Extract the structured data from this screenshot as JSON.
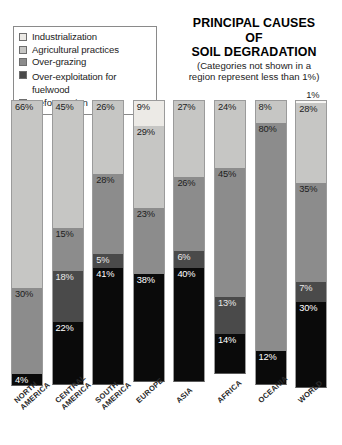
{
  "title": {
    "line1": "PRINCIPAL CAUSES",
    "line2": "OF",
    "line3": "SOIL DEGRADATION",
    "note_line1": "(Categories not shown in a",
    "note_line2": "region represent less than 1%)"
  },
  "legend": {
    "items": [
      {
        "label": "Industrialization",
        "color": "#eceae6"
      },
      {
        "label": "Agricultural practices",
        "color": "#c6c6c4"
      },
      {
        "label": "Over-grazing",
        "color": "#8c8c8c"
      },
      {
        "label": "Over-exploitation for",
        "label2": "fuelwood",
        "color": "#4a4a4a"
      },
      {
        "label": "Deforestation",
        "color": "#0a0a0a"
      }
    ]
  },
  "chart_data": {
    "type": "bar",
    "subtype": "stacked-bar-100",
    "title": "PRINCIPAL CAUSES OF SOIL DEGRADATION",
    "subtitle": "(Categories not shown in a region represent less than 1%)",
    "xlabel": "",
    "ylabel": "",
    "ylim": [
      0,
      100
    ],
    "grid": false,
    "legend_position": "top-left",
    "stack_order_top_to_bottom": [
      "Industrialization",
      "Agricultural practices",
      "Over-grazing",
      "Over-exploitation for fuelwood",
      "Deforestation"
    ],
    "categories": [
      "NORTH AMERICA",
      "CENTRAL AMERICA",
      "SOUTH AMERICA",
      "EUROPE",
      "ASIA",
      "AFRICA",
      "OCEANIA",
      "WORLD"
    ],
    "series": [
      {
        "name": "Industrialization",
        "color": "#eceae6",
        "values": [
          null,
          null,
          null,
          9,
          null,
          null,
          null,
          1
        ]
      },
      {
        "name": "Agricultural practices",
        "color": "#c6c6c4",
        "values": [
          66,
          45,
          26,
          29,
          27,
          24,
          8,
          28
        ]
      },
      {
        "name": "Over-grazing",
        "color": "#8c8c8c",
        "values": [
          30,
          15,
          28,
          23,
          26,
          45,
          80,
          35
        ]
      },
      {
        "name": "Over-exploitation for fuelwood",
        "color": "#4a4a4a",
        "values": [
          null,
          18,
          5,
          null,
          6,
          13,
          null,
          7
        ]
      },
      {
        "name": "Deforestation",
        "color": "#0a0a0a",
        "values": [
          4,
          22,
          41,
          38,
          40,
          14,
          12,
          30
        ]
      }
    ]
  },
  "columns": [
    {
      "name": "NORTH AMERICA",
      "label_lines": "NORTH\nAMERICA",
      "segments": [
        {
          "label": "66%",
          "value": 66,
          "color": "#c6c6c4",
          "text": "#1c1c1c",
          "outside": false
        },
        {
          "label": "30%",
          "value": 30,
          "color": "#8c8c8c",
          "text": "#1c1c1c",
          "outside": false
        },
        {
          "label": "4%",
          "value": 4,
          "color": "#0a0a0a",
          "text": "#ffffff",
          "outside": false
        }
      ]
    },
    {
      "name": "CENTRAL AMERICA",
      "label_lines": "CENTRAL\nAMERICA",
      "segments": [
        {
          "label": "45%",
          "value": 45,
          "color": "#c6c6c4",
          "text": "#1c1c1c",
          "outside": false
        },
        {
          "label": "15%",
          "value": 15,
          "color": "#8c8c8c",
          "text": "#1c1c1c",
          "outside": false
        },
        {
          "label": "18%",
          "value": 18,
          "color": "#4a4a4a",
          "text": "#e8e8e8",
          "outside": false
        },
        {
          "label": "22%",
          "value": 22,
          "color": "#0a0a0a",
          "text": "#ffffff",
          "outside": false
        }
      ]
    },
    {
      "name": "SOUTH AMERICA",
      "label_lines": "SOUTH\nAMERICA",
      "segments": [
        {
          "label": "26%",
          "value": 26,
          "color": "#c6c6c4",
          "text": "#1c1c1c",
          "outside": false
        },
        {
          "label": "28%",
          "value": 28,
          "color": "#8c8c8c",
          "text": "#1c1c1c",
          "outside": false
        },
        {
          "label": "5%",
          "value": 5,
          "color": "#4a4a4a",
          "text": "#e8e8e8",
          "outside": false
        },
        {
          "label": "41%",
          "value": 41,
          "color": "#0a0a0a",
          "text": "#ffffff",
          "outside": false
        }
      ]
    },
    {
      "name": "EUROPE",
      "label_lines": "EUROPE",
      "segments": [
        {
          "label": "9%",
          "value": 9,
          "color": "#eceae6",
          "text": "#1c1c1c",
          "outside": false
        },
        {
          "label": "29%",
          "value": 29,
          "color": "#c6c6c4",
          "text": "#1c1c1c",
          "outside": false
        },
        {
          "label": "23%",
          "value": 23,
          "color": "#8c8c8c",
          "text": "#1c1c1c",
          "outside": false
        },
        {
          "label": "38%",
          "value": 38,
          "color": "#0a0a0a",
          "text": "#ffffff",
          "outside": false
        }
      ]
    },
    {
      "name": "ASIA",
      "label_lines": "ASIA",
      "segments": [
        {
          "label": "27%",
          "value": 27,
          "color": "#c6c6c4",
          "text": "#1c1c1c",
          "outside": false
        },
        {
          "label": "26%",
          "value": 26,
          "color": "#8c8c8c",
          "text": "#1c1c1c",
          "outside": false
        },
        {
          "label": "6%",
          "value": 6,
          "color": "#4a4a4a",
          "text": "#e8e8e8",
          "outside": false
        },
        {
          "label": "40%",
          "value": 40,
          "color": "#0a0a0a",
          "text": "#ffffff",
          "outside": false
        }
      ]
    },
    {
      "name": "AFRICA",
      "label_lines": "AFRICA",
      "segments": [
        {
          "label": "24%",
          "value": 24,
          "color": "#c6c6c4",
          "text": "#1c1c1c",
          "outside": false
        },
        {
          "label": "45%",
          "value": 45,
          "color": "#8c8c8c",
          "text": "#1c1c1c",
          "outside": false
        },
        {
          "label": "13%",
          "value": 13,
          "color": "#4a4a4a",
          "text": "#e8e8e8",
          "outside": false
        },
        {
          "label": "14%",
          "value": 14,
          "color": "#0a0a0a",
          "text": "#ffffff",
          "outside": false
        }
      ]
    },
    {
      "name": "OCEANIA",
      "label_lines": "OCEANIA",
      "segments": [
        {
          "label": "8%",
          "value": 8,
          "color": "#c6c6c4",
          "text": "#1c1c1c",
          "outside": false
        },
        {
          "label": "80%",
          "value": 80,
          "color": "#8c8c8c",
          "text": "#1c1c1c",
          "outside": false
        },
        {
          "label": "12%",
          "value": 12,
          "color": "#0a0a0a",
          "text": "#ffffff",
          "outside": false
        }
      ]
    },
    {
      "name": "WORLD",
      "label_lines": "WORLD",
      "segments": [
        {
          "label": "1%",
          "value": 1,
          "color": "#f7f6f4",
          "text": "#1c1c1c",
          "outside": true
        },
        {
          "label": "28%",
          "value": 28,
          "color": "#c6c6c4",
          "text": "#1c1c1c",
          "outside": false
        },
        {
          "label": "35%",
          "value": 35,
          "color": "#8c8c8c",
          "text": "#1c1c1c",
          "outside": false
        },
        {
          "label": "7%",
          "value": 7,
          "color": "#4a4a4a",
          "text": "#e8e8e8",
          "outside": false
        },
        {
          "label": "30%",
          "value": 30,
          "color": "#0a0a0a",
          "text": "#ffffff",
          "outside": false
        }
      ]
    }
  ]
}
